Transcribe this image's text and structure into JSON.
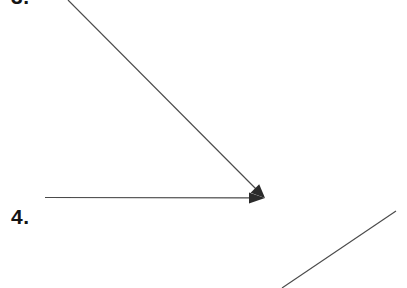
{
  "page": {
    "width": 407,
    "height": 288,
    "background_color": "#ffffff",
    "ink_color": "#4a4a4a",
    "text_color": "#141414"
  },
  "labels": [
    {
      "id": "item-3",
      "text": "3.",
      "note": "clipped at top edge of image, only lower portion of glyph visible"
    },
    {
      "id": "item-4",
      "text": "4."
    }
  ],
  "figures": {
    "angle": {
      "vertex": {
        "x": 265,
        "y": 198
      },
      "rays": [
        {
          "name": "descending-diagonal-ray",
          "from": {
            "x": 68,
            "y": 0
          },
          "to": {
            "x": 265,
            "y": 198
          },
          "arrowhead": "at-vertex"
        },
        {
          "name": "horizontal-ray",
          "from": {
            "x": 45,
            "y": 197
          },
          "to": {
            "x": 265,
            "y": 198
          },
          "arrowhead": "at-vertex"
        }
      ]
    },
    "segment": {
      "name": "lower-right-diagonal-segment",
      "from": {
        "x": 282,
        "y": 288
      },
      "to": {
        "x": 396,
        "y": 211
      },
      "arrowhead": "none"
    }
  }
}
